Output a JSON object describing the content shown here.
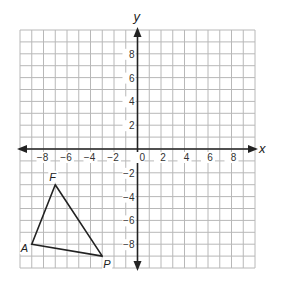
{
  "figure": {
    "type": "coordinate-plane",
    "x_axis_label": "x",
    "y_axis_label": "y",
    "range": {
      "xmin": -10,
      "xmax": 10,
      "ymin": -10,
      "ymax": 10
    },
    "x_tick_labels": [
      "-8",
      "-6",
      "-4",
      "-2",
      "0",
      "2",
      "4",
      "6",
      "8"
    ],
    "y_tick_labels": [
      "8",
      "6",
      "4",
      "2",
      "-2",
      "-4",
      "-6",
      "-8"
    ],
    "triangle": {
      "vertices": [
        {
          "label": "F",
          "x": -7,
          "y": -3
        },
        {
          "label": "A",
          "x": -9,
          "y": -8
        },
        {
          "label": "P",
          "x": -3,
          "y": -9
        }
      ]
    },
    "colors": {
      "grid": "#b8b8b8",
      "axis": "#222222",
      "shape": "#222222"
    }
  }
}
